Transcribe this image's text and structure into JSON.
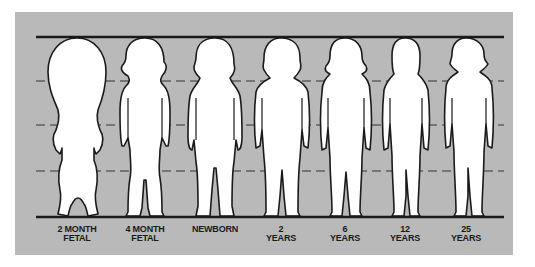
{
  "diagram": {
    "title": "",
    "background_color": "#b9b9b9",
    "line_color": "#1a1a1a",
    "figure_fill": "#ffffff",
    "guide_lines": {
      "top": "solid",
      "middle": [
        "dashed",
        "dashed",
        "dashed"
      ],
      "bottom": "solid"
    },
    "figures": [
      {
        "id": "2-month-fetal",
        "label_line1": "2 MONTH",
        "label_line2": "FETAL"
      },
      {
        "id": "4-month-fetal",
        "label_line1": "4 MONTH",
        "label_line2": "FETAL"
      },
      {
        "id": "newborn",
        "label_line1": "NEWBORN",
        "label_line2": ""
      },
      {
        "id": "2-years",
        "label_line1": "2",
        "label_line2": "YEARS"
      },
      {
        "id": "6-years",
        "label_line1": "6",
        "label_line2": "YEARS"
      },
      {
        "id": "12-years",
        "label_line1": "12",
        "label_line2": "YEARS"
      },
      {
        "id": "25-years",
        "label_line1": "25",
        "label_line2": "YEARS"
      }
    ]
  }
}
